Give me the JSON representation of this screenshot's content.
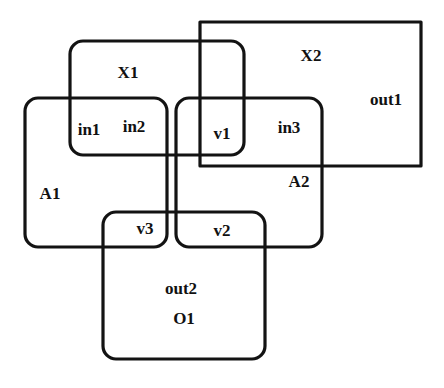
{
  "diagram": {
    "type": "nested-region-venn-diagram",
    "canvas": {
      "width": 444,
      "height": 388,
      "background": "#ffffff"
    },
    "stroke_color": "#131313",
    "text_color": "#111111",
    "shapes": [
      {
        "id": "X2",
        "label": "X2",
        "corner": "sharp",
        "rect": {
          "x": 200,
          "y": 22,
          "width": 221,
          "height": 144
        },
        "label_pos": {
          "x": 311,
          "y": 55
        }
      },
      {
        "id": "X1",
        "label": "X1",
        "corner": "rounded",
        "rect": {
          "x": 70,
          "y": 41,
          "width": 174,
          "height": 114
        },
        "radius": 13,
        "label_pos": {
          "x": 128,
          "y": 72
        }
      },
      {
        "id": "A1",
        "label": "A1",
        "corner": "rounded",
        "rect": {
          "x": 25,
          "y": 98,
          "width": 142,
          "height": 149
        },
        "radius": 13,
        "label_pos": {
          "x": 50,
          "y": 193
        }
      },
      {
        "id": "A2",
        "label": "A2",
        "corner": "rounded",
        "rect": {
          "x": 176,
          "y": 98,
          "width": 146,
          "height": 149
        },
        "radius": 13,
        "label_pos": {
          "x": 299,
          "y": 181
        }
      },
      {
        "id": "O1",
        "label": "O1",
        "corner": "rounded",
        "rect": {
          "x": 103,
          "y": 212,
          "width": 162,
          "height": 147
        },
        "radius": 13,
        "label_pos": {
          "x": 184,
          "y": 318
        }
      }
    ],
    "region_labels": [
      {
        "id": "in1",
        "text": "in1",
        "x": 89,
        "y": 129
      },
      {
        "id": "in2",
        "text": "in2",
        "x": 134,
        "y": 126
      },
      {
        "id": "v1",
        "text": "v1",
        "x": 222,
        "y": 133
      },
      {
        "id": "in3",
        "text": "in3",
        "x": 289,
        "y": 127
      },
      {
        "id": "out1",
        "text": "out1",
        "x": 386,
        "y": 99
      },
      {
        "id": "v3",
        "text": "v3",
        "x": 145,
        "y": 228
      },
      {
        "id": "v2",
        "text": "v2",
        "x": 222,
        "y": 230
      },
      {
        "id": "out2",
        "text": "out2",
        "x": 181,
        "y": 288
      }
    ]
  }
}
